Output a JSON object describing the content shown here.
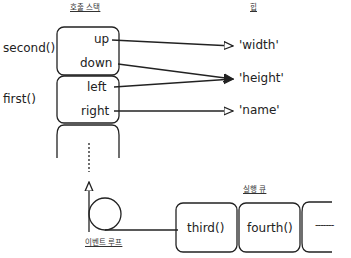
{
  "headers": {
    "call_stack": "호출 스택",
    "heap": "힙",
    "run_queue": "실행 큐",
    "event_loop": "이벤트 루프"
  },
  "stack_frames": [
    {
      "name": "second()",
      "vars": [
        "up",
        "down"
      ]
    },
    {
      "name": "first()",
      "vars": [
        "left",
        "right"
      ]
    }
  ],
  "heap_items": [
    "'width'",
    "'height'",
    "'name'"
  ],
  "references": [
    {
      "from": "up",
      "to": "'width'"
    },
    {
      "from": "down",
      "to": "'height'"
    },
    {
      "from": "left",
      "to": "'height'"
    },
    {
      "from": "right",
      "to": "'name'"
    }
  ],
  "queue_items": [
    "third()",
    "fourth()"
  ],
  "queue_more": "-------"
}
